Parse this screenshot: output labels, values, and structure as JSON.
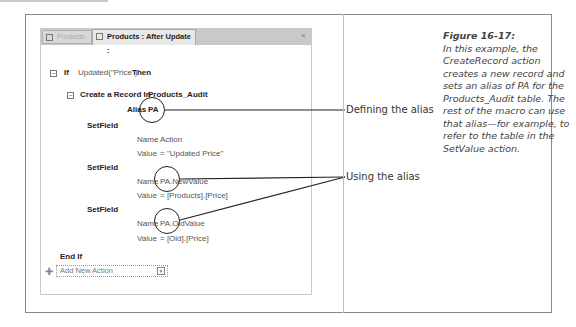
{
  "tabs": [
    {
      "label": "Products"
    },
    {
      "label": "Products : After Update :"
    }
  ],
  "macro": {
    "if_keyword": "If",
    "if_condition": "Updated(\"Price\")",
    "then_keyword": "Then",
    "create_record": {
      "label": "Create a Record In",
      "table": "Products_Audit",
      "alias_label": "Alias",
      "alias_value": "PA"
    },
    "setfields": [
      {
        "label": "SetField",
        "name_label": "Name",
        "name_value": "Action",
        "value_label": "Value",
        "value_value": "= \"Updated Price\""
      },
      {
        "label": "SetField",
        "name_label": "Name",
        "name_value": "PA.NewValue",
        "value_label": "Value",
        "value_value": "= [Products].[Price]"
      },
      {
        "label": "SetField",
        "name_label": "Name",
        "name_value": "PA.OldValue",
        "value_label": "Value",
        "value_value": "= [Old].[Price]"
      }
    ],
    "end_if": "End If",
    "add_action_placeholder": "Add New Action"
  },
  "callouts": {
    "defining": "Defining the alias",
    "using": "Using the alias"
  },
  "caption": {
    "title": "Figure 16-17:",
    "body": "In this example, the CreateRecord action creates a new record and sets an alias of PA for the Products_Audit table. The rest of the macro can use that alias—for example, to refer to the table in the SetValue action."
  }
}
